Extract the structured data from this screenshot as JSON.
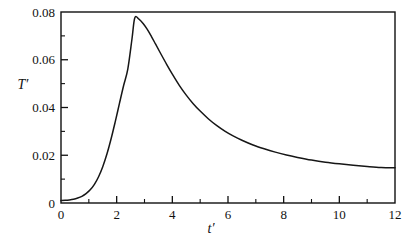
{
  "figure": {
    "background_color": "#ffffff",
    "frame_color": "#101010",
    "curve_color": "#161616"
  },
  "axis_titles": {
    "y": "T′",
    "x": "t′"
  },
  "chart_data": {
    "type": "line",
    "title": "",
    "subtitle": "",
    "xlabel": "t′",
    "ylabel": "T′",
    "xlim": [
      0,
      12
    ],
    "ylim": [
      0,
      0.08
    ],
    "grid": false,
    "legend": null,
    "x_major_ticks": [
      0,
      2,
      4,
      6,
      8,
      10,
      12
    ],
    "x_major_tick_labels": [
      "0",
      "2",
      "4",
      "6",
      "8",
      "10",
      "12"
    ],
    "x_minor_ticks": [
      1,
      3,
      5,
      7,
      9,
      11
    ],
    "y_major_ticks": [
      0,
      0.02,
      0.04,
      0.06,
      0.08
    ],
    "y_major_tick_labels": [
      "0",
      "0.02",
      "0.04",
      "0.06",
      "0.08"
    ],
    "y_minor_ticks": [
      0.01,
      0.03,
      0.05,
      0.07
    ],
    "tick_direction": "in",
    "peak": {
      "x": 2.65,
      "y": 0.0775
    },
    "series": [
      {
        "name": "T′(t′)",
        "x": [
          0.0,
          0.15,
          0.3,
          0.45,
          0.6,
          0.75,
          0.9,
          1.05,
          1.2,
          1.35,
          1.5,
          1.65,
          1.8,
          1.95,
          2.1,
          2.25,
          2.4,
          2.55,
          2.65,
          2.8,
          2.95,
          3.1,
          3.25,
          3.4,
          3.6,
          3.8,
          4.0,
          4.25,
          4.5,
          4.75,
          5.0,
          5.3,
          5.6,
          5.9,
          6.2,
          6.5,
          6.9,
          7.3,
          7.7,
          8.1,
          8.5,
          9.0,
          9.5,
          10.0,
          10.5,
          11.0,
          11.5,
          12.0
        ],
        "y": [
          0.001,
          0.0011,
          0.0013,
          0.0016,
          0.0021,
          0.0028,
          0.0039,
          0.0055,
          0.0078,
          0.011,
          0.0152,
          0.0205,
          0.0269,
          0.0341,
          0.0417,
          0.0492,
          0.0561,
          0.0687,
          0.0775,
          0.077,
          0.0752,
          0.0727,
          0.0697,
          0.0665,
          0.0622,
          0.058,
          0.054,
          0.0493,
          0.0452,
          0.0416,
          0.0385,
          0.0352,
          0.0324,
          0.03,
          0.028,
          0.0263,
          0.0243,
          0.0227,
          0.0213,
          0.0201,
          0.0191,
          0.018,
          0.0171,
          0.0164,
          0.0158,
          0.0153,
          0.0149,
          0.0148
        ]
      }
    ]
  }
}
